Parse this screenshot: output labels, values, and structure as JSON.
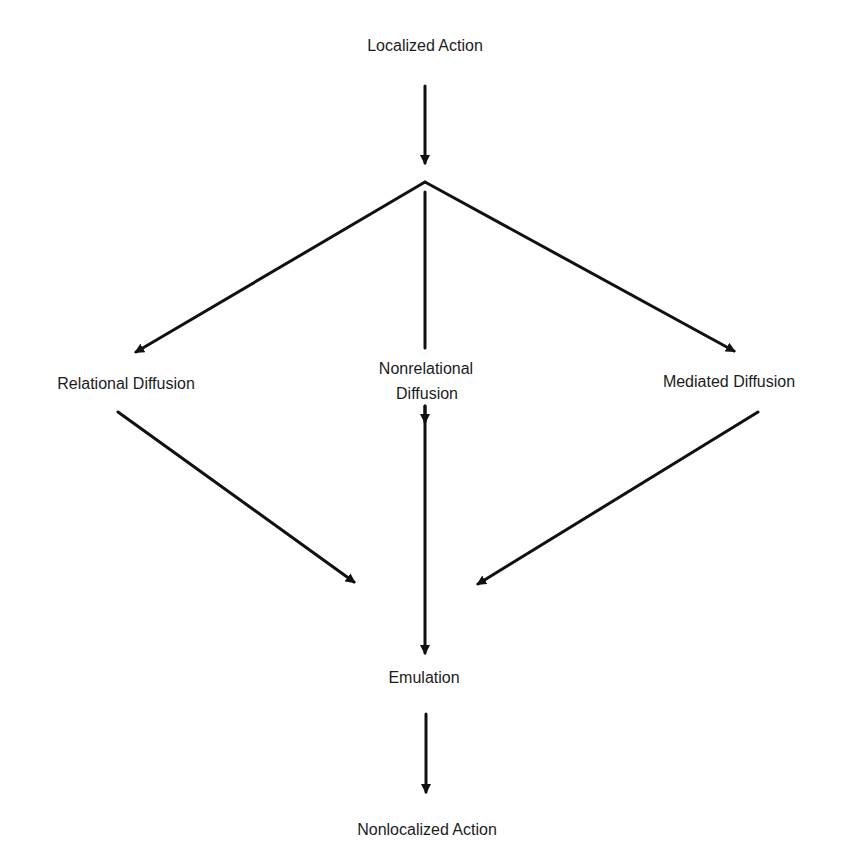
{
  "diagram": {
    "nodes": {
      "localized_action": "Localized Action",
      "relational_diffusion": "Relational Diffusion",
      "nonrelational_diffusion_line1": "Nonrelational",
      "nonrelational_diffusion_line2": "Diffusion",
      "mediated_diffusion": "Mediated Diffusion",
      "emulation": "Emulation",
      "nonlocalized_action": "Nonlocalized Action"
    },
    "edges": [
      {
        "from": "Localized Action",
        "to": "branch point"
      },
      {
        "from": "branch point",
        "to": "Relational Diffusion"
      },
      {
        "from": "branch point",
        "to": "Nonrelational Diffusion"
      },
      {
        "from": "branch point",
        "to": "Mediated Diffusion"
      },
      {
        "from": "Relational Diffusion",
        "to": "Emulation"
      },
      {
        "from": "Nonrelational Diffusion",
        "to": "Emulation"
      },
      {
        "from": "Mediated Diffusion",
        "to": "Emulation"
      },
      {
        "from": "Emulation",
        "to": "Nonlocalized Action"
      }
    ],
    "line_color": "#111111"
  }
}
